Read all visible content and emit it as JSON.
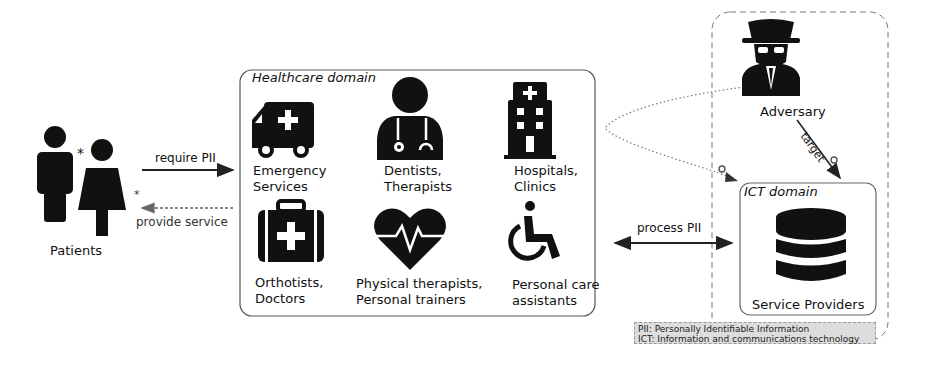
{
  "patients": {
    "label": "Patients",
    "marker": "*"
  },
  "arrows": {
    "require": "require PII",
    "provide": "provide service",
    "process": "process PII",
    "target": "target"
  },
  "healthcare": {
    "title": "Healthcare domain",
    "items": [
      {
        "icon": "ambulance-icon",
        "line1": "Emergency",
        "line2": "Services"
      },
      {
        "icon": "doctor-icon",
        "line1": "Dentists,",
        "line2": "Therapists"
      },
      {
        "icon": "hospital-icon",
        "line1": "Hospitals,",
        "line2": "Clinics"
      },
      {
        "icon": "medical-kit-icon",
        "line1": "Orthotists,",
        "line2": "Doctors"
      },
      {
        "icon": "heartbeat-icon",
        "line1": "Physical therapists,",
        "line2": "Personal trainers"
      },
      {
        "icon": "wheelchair-icon",
        "line1": "Personal care",
        "line2": "assistants"
      }
    ]
  },
  "adversary": {
    "label": "Adversary"
  },
  "ict": {
    "title": "ICT domain",
    "label": "Service Providers"
  },
  "legend": {
    "line1": "PII: Personally Identifiable Information",
    "line2": "ICT: Information and communications technology"
  }
}
